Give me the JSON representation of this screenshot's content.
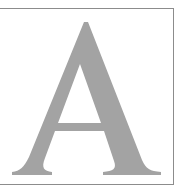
{
  "figure": {
    "letter": "A",
    "glyph_color": "#a3a3a3",
    "border_color": "#8c8c8c",
    "background_color": "#ffffff"
  }
}
